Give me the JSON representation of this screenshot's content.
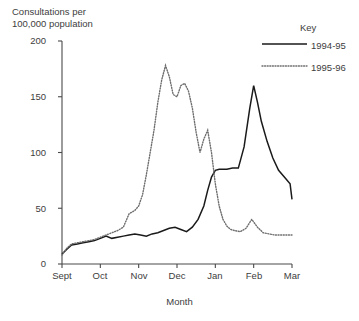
{
  "chart_data": {
    "type": "line",
    "title": "",
    "ylabel": "Consultations per\n100,000 population",
    "xlabel": "Month",
    "ylim": [
      0,
      200
    ],
    "yticks": [
      0,
      50,
      100,
      150,
      200
    ],
    "ytick_labels": [
      "0",
      "50",
      "100",
      "150",
      "200"
    ],
    "categories": [
      "Sept",
      "Oct",
      "Nov",
      "Dec",
      "Jan",
      "Feb",
      "Mar"
    ],
    "xtick_labels": [
      "Sept",
      "Oct",
      "Nov",
      "Dec",
      "Jan",
      "Feb",
      "Mar"
    ],
    "grid": false,
    "legend_position": "top-right",
    "legend_title": "Key",
    "series": [
      {
        "name": "1994-95",
        "style": "solid",
        "color": "#1a1a1a",
        "x": [
          0.0,
          0.12,
          0.25,
          0.4,
          0.55,
          0.7,
          0.85,
          1.0,
          1.15,
          1.3,
          1.45,
          1.6,
          1.75,
          1.9,
          2.05,
          2.2,
          2.35,
          2.5,
          2.65,
          2.8,
          2.95,
          3.1,
          3.25,
          3.4,
          3.55,
          3.7,
          3.8,
          3.9,
          4.0,
          4.1,
          4.2,
          4.3,
          4.45,
          4.6,
          4.75,
          4.9,
          5.0,
          5.1,
          5.2,
          5.35,
          5.5,
          5.65,
          5.8,
          5.95,
          6.0
        ],
        "values": [
          9,
          13,
          17,
          18,
          19,
          20,
          21,
          23,
          25,
          23,
          24,
          25,
          26,
          27,
          26,
          25,
          27,
          28,
          30,
          32,
          33,
          31,
          29,
          33,
          40,
          52,
          66,
          78,
          84,
          85,
          85,
          85,
          86,
          86,
          105,
          140,
          160,
          145,
          128,
          110,
          95,
          84,
          78,
          72,
          58
        ]
      },
      {
        "name": "1995-96",
        "style": "dotted",
        "color": "#6b6b6b",
        "x": [
          0.0,
          0.12,
          0.25,
          0.4,
          0.55,
          0.7,
          0.85,
          1.0,
          1.15,
          1.3,
          1.45,
          1.6,
          1.75,
          1.9,
          2.0,
          2.1,
          2.2,
          2.3,
          2.4,
          2.5,
          2.6,
          2.7,
          2.8,
          2.9,
          3.0,
          3.1,
          3.2,
          3.3,
          3.4,
          3.5,
          3.6,
          3.7,
          3.8,
          3.9,
          4.0,
          4.1,
          4.2,
          4.3,
          4.4,
          4.5,
          4.65,
          4.8,
          4.95,
          5.1,
          5.25,
          5.4,
          5.55,
          5.7,
          5.85,
          6.0
        ],
        "values": [
          8,
          14,
          18,
          19,
          20,
          21,
          22,
          24,
          26,
          28,
          30,
          33,
          45,
          48,
          52,
          62,
          80,
          100,
          120,
          145,
          165,
          178,
          168,
          152,
          150,
          160,
          162,
          155,
          140,
          118,
          100,
          112,
          120,
          100,
          72,
          52,
          40,
          34,
          31,
          30,
          29,
          32,
          40,
          33,
          28,
          27,
          26,
          26,
          26,
          26
        ]
      }
    ]
  },
  "axis": {
    "y_top_px": 41,
    "y_bottom_px": 264,
    "x_left_px": 62,
    "x_right_px": 292
  },
  "legend": {
    "title": "Key",
    "items": [
      {
        "label": "1994-95",
        "style": "solid"
      },
      {
        "label": "1995-96",
        "style": "dotted"
      }
    ]
  }
}
